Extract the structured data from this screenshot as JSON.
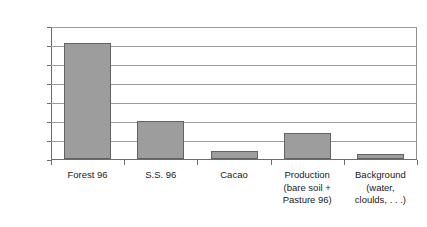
{
  "chart_data": {
    "type": "bar",
    "title": "",
    "subtitle": "",
    "xlabel": "",
    "ylabel": "Percentage of total colonization area",
    "ylim": [
      0,
      70
    ],
    "ytick_labels": [
      "0",
      "10",
      "20",
      "30",
      "40",
      "50",
      "60",
      "70"
    ],
    "ytick_values": [
      0,
      10,
      20,
      30,
      40,
      50,
      60,
      70
    ],
    "grid": "horizontal",
    "legend": "none",
    "bar_fill_color": "#9d9d9d",
    "bar_border_color": "#626262",
    "gridline_color": "#9b9b9b",
    "axis_color": "#6d6d6d",
    "categories": [
      "Forest 96",
      "S.S. 96",
      "Cacao",
      "Production\n(bare soil +\nPasture 96)",
      "Background\n(water,\ncloulds, . . .)"
    ],
    "values": [
      61,
      20,
      4,
      13.5,
      2.5
    ],
    "series": [
      {
        "name": "Percentage of total colonization area",
        "values": [
          61,
          20,
          4,
          13.5,
          2.5
        ]
      }
    ]
  }
}
